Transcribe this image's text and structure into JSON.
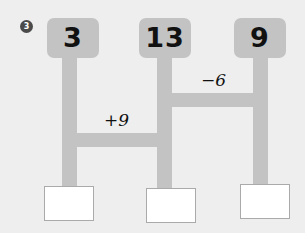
{
  "problem": {
    "number": "3",
    "marker_color": "#4a4a4a"
  },
  "colors": {
    "background": "#eeeeee",
    "bar": "#c3c3c3",
    "answer_fill": "#ffffff",
    "answer_border": "#aaaaaa",
    "text": "#111111"
  },
  "chart_data": {
    "type": "diagram",
    "title": "",
    "nodes": [
      {
        "id": 0,
        "value": "3"
      },
      {
        "id": 1,
        "value": "13"
      },
      {
        "id": 2,
        "value": "9"
      }
    ],
    "connectors": [
      {
        "from": 0,
        "to": 1,
        "label": "+9",
        "level": "low"
      },
      {
        "from": 1,
        "to": 2,
        "label": "−6",
        "level": "high"
      }
    ],
    "answers": [
      {
        "id": 0,
        "value": ""
      },
      {
        "id": 1,
        "value": ""
      },
      {
        "id": 2,
        "value": ""
      }
    ]
  }
}
